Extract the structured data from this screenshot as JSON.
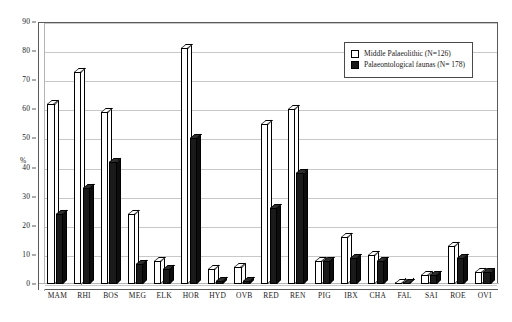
{
  "chart_data": {
    "type": "bar",
    "title": "",
    "subtitle": "",
    "xlabel": "",
    "ylabel": "%",
    "ylim": [
      0,
      90
    ],
    "ytick_step": 10,
    "yticks": [
      90,
      80,
      70,
      60,
      50,
      40,
      30,
      20,
      10,
      0
    ],
    "grid": true,
    "legend_position": "upper-right",
    "style": "3d-column",
    "categories": [
      "MAM",
      "RHI",
      "BOS",
      "MEG",
      "ELK",
      "HOR",
      "HYD",
      "OVB",
      "RED",
      "REN",
      "PIG",
      "IBX",
      "CHA",
      "FAL",
      "SAI",
      "ROE",
      "OVI"
    ],
    "series": [
      {
        "name": "Middle Palaeolithic (N=126)",
        "color": "#ffffff",
        "values": [
          62,
          73,
          59,
          24,
          8,
          81,
          5,
          6,
          55,
          60,
          8,
          16,
          10,
          0,
          3,
          13,
          4
        ]
      },
      {
        "name": "Palaeontological faunas (N= 178)",
        "color": "#1a1a1a",
        "values": [
          24,
          33,
          42,
          7,
          5,
          50,
          1,
          1,
          26,
          38,
          8,
          9,
          8,
          0.5,
          3,
          9,
          4
        ]
      }
    ]
  },
  "legend": {
    "items": [
      {
        "label": "Middle Palaeolithic (N=126)",
        "swatch": "light"
      },
      {
        "label": "Palaeontological faunas (N= 178)",
        "swatch": "dark"
      }
    ]
  },
  "axes": {
    "y_title": "%",
    "y_labels": [
      "90",
      "80",
      "70",
      "60",
      "50",
      "40",
      "30",
      "20",
      "10",
      "0"
    ],
    "x_labels": [
      "MAM",
      "RHI",
      "BOS",
      "MEG",
      "ELK",
      "HOR",
      "HYD",
      "OVB",
      "RED",
      "REN",
      "PIG",
      "IBX",
      "CHA",
      "FAL",
      "SAI",
      "ROE",
      "OVI"
    ]
  }
}
